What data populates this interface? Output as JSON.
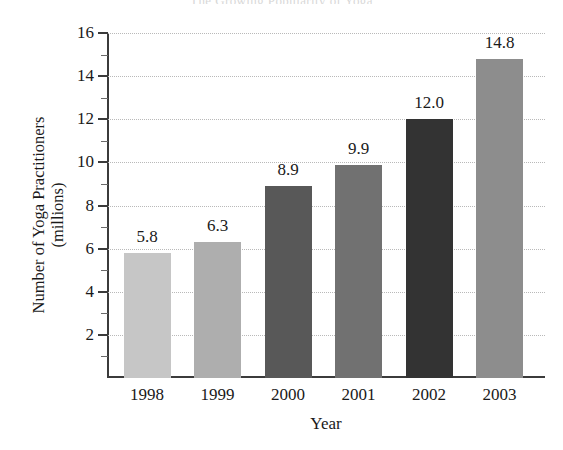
{
  "clipped_title": "The Growing Popularity of Yoga",
  "chart_data": {
    "type": "bar",
    "title": "",
    "xlabel": "Year",
    "ylabel": "Number of Yoga Practitioners\n(millions)",
    "categories": [
      "1998",
      "1999",
      "2000",
      "2001",
      "2002",
      "2003"
    ],
    "values": [
      5.8,
      6.3,
      8.9,
      9.9,
      12.0,
      14.8
    ],
    "value_labels": [
      "5.8",
      "6.3",
      "8.9",
      "9.9",
      "12.0",
      "14.8"
    ],
    "bar_colors": [
      "#c6c6c6",
      "#aeaeae",
      "#585858",
      "#717171",
      "#333333",
      "#8d8d8d"
    ],
    "ylim": [
      0,
      16
    ],
    "ytick_labels": [
      "2",
      "4",
      "6",
      "8",
      "10",
      "12",
      "14",
      "16"
    ],
    "ytick_values": [
      2,
      4,
      6,
      8,
      10,
      12,
      14,
      16
    ],
    "yminor_values": [
      1,
      3,
      5,
      7,
      9,
      11,
      13,
      15
    ],
    "grid": true,
    "grid_style": "dotted",
    "legend": "none"
  }
}
